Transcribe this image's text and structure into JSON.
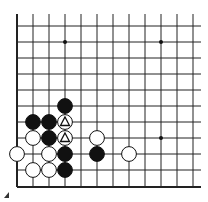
{
  "board": {
    "origin_x": 17,
    "origin_y": 26,
    "spacing": 16,
    "columns": 12,
    "rows": 11,
    "line_color": "#222222",
    "left_edge": true,
    "bottom_edge": true,
    "star_points": [
      [
        3,
        1
      ],
      [
        9,
        1
      ],
      [
        9,
        7
      ]
    ],
    "stones": [
      {
        "color": "black",
        "col": 3,
        "row": 5
      },
      {
        "color": "black",
        "col": 1,
        "row": 6
      },
      {
        "color": "black",
        "col": 2,
        "row": 6
      },
      {
        "color": "white",
        "col": 3,
        "row": 6,
        "mark": "triangle"
      },
      {
        "color": "white",
        "col": 1,
        "row": 7
      },
      {
        "color": "black",
        "col": 2,
        "row": 7
      },
      {
        "color": "white",
        "col": 3,
        "row": 7,
        "mark": "triangle"
      },
      {
        "color": "white",
        "col": 5,
        "row": 7
      },
      {
        "color": "white",
        "col": 0,
        "row": 8
      },
      {
        "color": "white",
        "col": 2,
        "row": 8
      },
      {
        "color": "black",
        "col": 3,
        "row": 8
      },
      {
        "color": "black",
        "col": 5,
        "row": 8
      },
      {
        "color": "white",
        "col": 7,
        "row": 8
      },
      {
        "color": "white",
        "col": 1,
        "row": 9
      },
      {
        "color": "white",
        "col": 2,
        "row": 9
      },
      {
        "color": "black",
        "col": 3,
        "row": 9
      }
    ]
  }
}
